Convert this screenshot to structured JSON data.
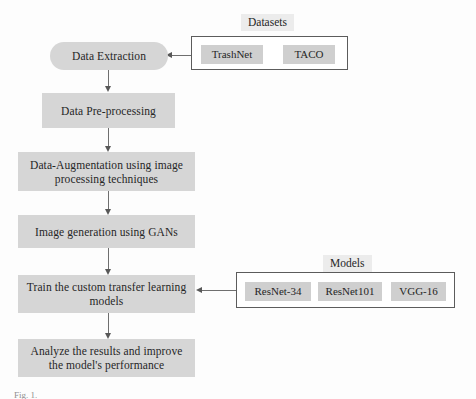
{
  "diagram": {
    "type": "flowchart",
    "orientation": "top-to-bottom",
    "flow_nodes": [
      {
        "id": "data-extraction",
        "label": "Data Extraction",
        "shape": "pill"
      },
      {
        "id": "data-preprocessing",
        "label": "Data Pre-processing",
        "shape": "rect"
      },
      {
        "id": "data-augmentation",
        "label": "Data-Augmentation using image processing techniques",
        "shape": "rect"
      },
      {
        "id": "image-generation",
        "label": "Image generation using GANs",
        "shape": "rect"
      },
      {
        "id": "train-models",
        "label": "Train the custom transfer learning models",
        "shape": "rect"
      },
      {
        "id": "analyze-results",
        "label": "Analyze the results and improve the model's performance",
        "shape": "rect"
      }
    ],
    "groups": [
      {
        "id": "datasets",
        "title": "Datasets",
        "items": [
          "TrashNet",
          "TACO"
        ],
        "target": "data-extraction"
      },
      {
        "id": "models",
        "title": "Models",
        "items": [
          "ResNet-34",
          "ResNet101",
          "VGG-16"
        ],
        "target": "train-models"
      }
    ],
    "edges": [
      {
        "from": "data-extraction",
        "to": "data-preprocessing",
        "direction": "down"
      },
      {
        "from": "data-preprocessing",
        "to": "data-augmentation",
        "direction": "down"
      },
      {
        "from": "data-augmentation",
        "to": "image-generation",
        "direction": "down"
      },
      {
        "from": "image-generation",
        "to": "train-models",
        "direction": "down"
      },
      {
        "from": "train-models",
        "to": "analyze-results",
        "direction": "down"
      },
      {
        "from": "datasets",
        "to": "data-extraction",
        "direction": "left"
      },
      {
        "from": "models",
        "to": "train-models",
        "direction": "left"
      }
    ],
    "colors": {
      "node_fill": "#d6d6d6",
      "chip_fill": "#cfcfcf",
      "group_border": "#5c5c5c",
      "group_title_fill": "#ececec",
      "connector": "#6f6f6f",
      "text": "#262626",
      "background": "#fdfdfd"
    }
  },
  "caption": {
    "text": "Fig. 1."
  }
}
